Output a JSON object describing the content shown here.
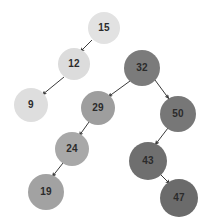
{
  "diagram": {
    "type": "binary-search-tree",
    "canvas": {
      "width": 206,
      "height": 221,
      "background": "#ffffff"
    },
    "edge_color": "#3a3a3a",
    "nodes": [
      {
        "id": "n15",
        "label": "15",
        "cx": 104,
        "cy": 28,
        "r": 16,
        "fill": "#e2e2e2"
      },
      {
        "id": "n12",
        "label": "12",
        "cx": 74,
        "cy": 64,
        "r": 16,
        "fill": "#dcdcdc"
      },
      {
        "id": "n9",
        "label": "9",
        "cx": 31,
        "cy": 105,
        "r": 17,
        "fill": "#dedede"
      },
      {
        "id": "n32",
        "label": "32",
        "cx": 142,
        "cy": 68,
        "r": 18,
        "fill": "#7b7b7b"
      },
      {
        "id": "n29",
        "label": "29",
        "cx": 98,
        "cy": 108,
        "r": 17,
        "fill": "#9e9e9e"
      },
      {
        "id": "n50",
        "label": "50",
        "cx": 178,
        "cy": 114,
        "r": 18,
        "fill": "#777777"
      },
      {
        "id": "n24",
        "label": "24",
        "cx": 72,
        "cy": 149,
        "r": 17,
        "fill": "#a8a8a8"
      },
      {
        "id": "n43",
        "label": "43",
        "cx": 148,
        "cy": 161,
        "r": 19,
        "fill": "#6f6f6f"
      },
      {
        "id": "n19",
        "label": "19",
        "cx": 46,
        "cy": 192,
        "r": 18,
        "fill": "#a2a2a2"
      },
      {
        "id": "n47",
        "label": "47",
        "cx": 179,
        "cy": 198,
        "r": 19,
        "fill": "#6b6b6b"
      }
    ],
    "edges": [
      {
        "id": "e-15-12",
        "from": "n15",
        "to": "n12",
        "x1": 92,
        "y1": 40,
        "x2": 80,
        "y2": 52
      },
      {
        "id": "e-12-9",
        "from": "n12",
        "to": "n9",
        "x1": 64,
        "y1": 77,
        "x2": 42,
        "y2": 95
      },
      {
        "id": "e-32-29",
        "from": "n32",
        "to": "n29",
        "x1": 130,
        "y1": 81,
        "x2": 108,
        "y2": 97
      },
      {
        "id": "e-32-50",
        "from": "n32",
        "to": "n50",
        "x1": 155,
        "y1": 80,
        "x2": 169,
        "y2": 99
      },
      {
        "id": "e-29-24",
        "from": "n29",
        "to": "n24",
        "x1": 89,
        "y1": 122,
        "x2": 79,
        "y2": 136
      },
      {
        "id": "e-24-19",
        "from": "n24",
        "to": "n19",
        "x1": 63,
        "y1": 163,
        "x2": 52,
        "y2": 177
      },
      {
        "id": "e-50-43",
        "from": "n50",
        "to": "n43",
        "x1": 168,
        "y1": 128,
        "x2": 155,
        "y2": 145
      },
      {
        "id": "e-43-47",
        "from": "n43",
        "to": "n47",
        "x1": 160,
        "y1": 174,
        "x2": 170,
        "y2": 184
      }
    ]
  }
}
